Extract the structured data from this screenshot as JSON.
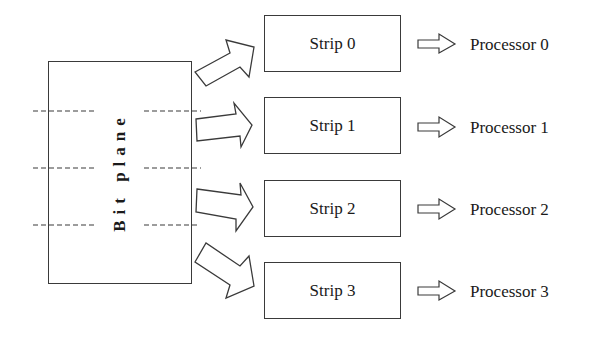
{
  "diagram": {
    "source_block": {
      "label": "Bit plane",
      "partition_lines": 3
    },
    "strips": [
      {
        "label": "Strip 0",
        "processor": "Processor 0"
      },
      {
        "label": "Strip 1",
        "processor": "Processor 1"
      },
      {
        "label": "Strip 2",
        "processor": "Processor 2"
      },
      {
        "label": "Strip 3",
        "processor": "Processor 3"
      }
    ],
    "colors": {
      "stroke": "#3a3a3a",
      "text": "#1a1a1a",
      "background": "#ffffff"
    }
  }
}
